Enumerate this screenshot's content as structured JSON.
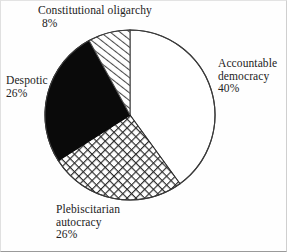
{
  "chart_data": {
    "type": "pie",
    "title": "",
    "subtitle": "",
    "xlabel": "",
    "ylabel": "",
    "legend_position": "none",
    "grid": false,
    "units": "percent",
    "start_angle_deg": 0,
    "direction": "counterclockwise",
    "center": {
      "x": 130,
      "y": 115
    },
    "radius": 85,
    "categories": [
      "Accountable democracy",
      "Plebiscitarian autocracy",
      "Despotic",
      "Constitutional oligarchy"
    ],
    "values": [
      40,
      26,
      26,
      8
    ],
    "slices": [
      {
        "label": "Accountable democracy",
        "label_lines": [
          "Accountable",
          "democracy"
        ],
        "value": 40,
        "value_text": "40%",
        "fill": "white",
        "fill_color": "#ffffff",
        "stroke_color": "#3a3a3a",
        "start_deg": 0,
        "end_deg": 144
      },
      {
        "label": "Plebiscitarian autocracy",
        "label_lines": [
          "Plebiscitarian",
          "autocracy"
        ],
        "value": 26,
        "value_text": "26%",
        "fill": "crosshatch",
        "fill_color": "#ffffff",
        "stroke_color": "#2b2b2b",
        "start_deg": 144,
        "end_deg": 237.6
      },
      {
        "label": "Despotic",
        "label_lines": [
          "Despotic"
        ],
        "value": 26,
        "value_text": "26%",
        "fill": "solid-black",
        "fill_color": "#0a0a0a",
        "stroke_color": "#0a0a0a",
        "start_deg": 237.6,
        "end_deg": 331.2
      },
      {
        "label": "Constitutional oligarchy",
        "label_lines": [
          "Constitutional oligarchy"
        ],
        "value": 8,
        "value_text": "8%",
        "fill": "diagonal-hatch",
        "fill_color": "#ffffff",
        "stroke_color": "#4a4a4a",
        "start_deg": 331.2,
        "end_deg": 360
      }
    ]
  },
  "labels": {
    "oligarchy": {
      "name": "Constitutional oligarchy",
      "percent": "8%"
    },
    "democracy": {
      "line1": "Accountable",
      "line2": "democracy",
      "percent": "40%"
    },
    "despotic": {
      "name": "Despotic",
      "percent": "26%"
    },
    "autocracy": {
      "line1": "Plebiscitarian",
      "line2": "autocracy",
      "percent": "26%"
    }
  },
  "colors": {
    "ink": "#2b2b2b",
    "black_slice": "#0a0a0a",
    "paper": "#fefefe",
    "frame": "#c9c9c9"
  }
}
